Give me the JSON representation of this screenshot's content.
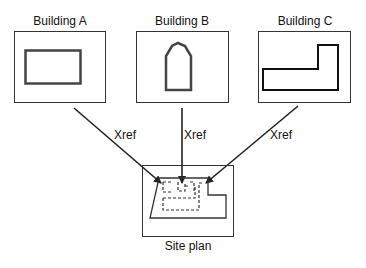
{
  "diagram": {
    "buildings": [
      {
        "label": "Building A",
        "shape": "rectangle"
      },
      {
        "label": "Building B",
        "shape": "arch"
      },
      {
        "label": "Building C",
        "shape": "l-shape"
      }
    ],
    "arrows": [
      {
        "label": "Xref",
        "from": "Building A",
        "to": "Site plan"
      },
      {
        "label": "Xref",
        "from": "Building B",
        "to": "Site plan"
      },
      {
        "label": "Xref",
        "from": "Building C",
        "to": "Site plan"
      }
    ],
    "site": {
      "label": "Site plan"
    },
    "colors": {
      "stroke": "#222222",
      "background": "#ffffff"
    }
  }
}
